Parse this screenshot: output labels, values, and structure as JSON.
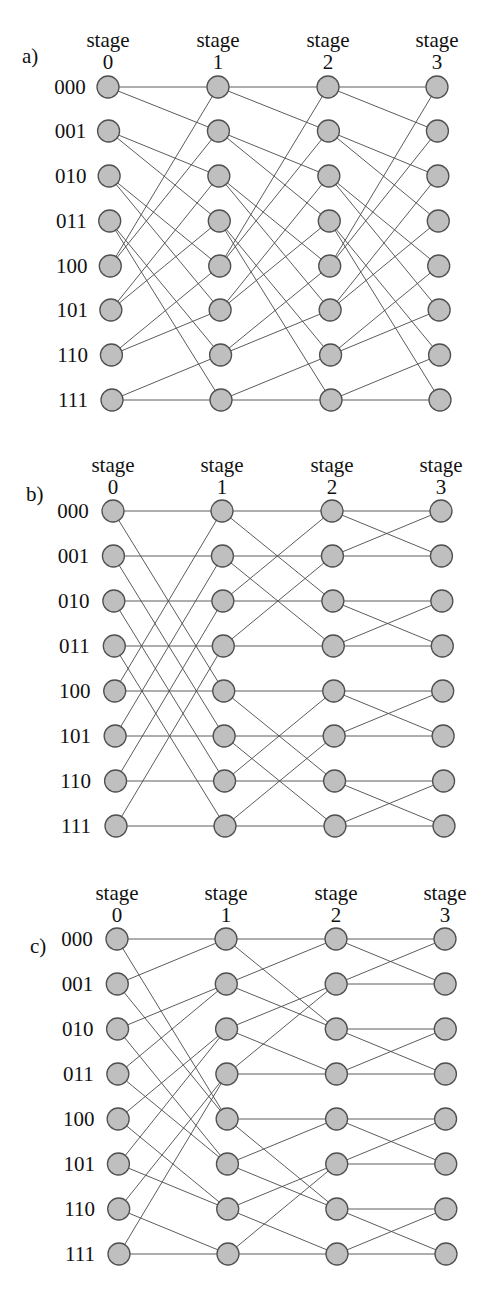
{
  "style": {
    "node_fill": "#bfbfbf",
    "node_stroke": "#505050",
    "edge_color": "#4a4a4a",
    "node_radius": 11
  },
  "stage_word": "stage",
  "row_labels": [
    "000",
    "001",
    "010",
    "011",
    "100",
    "101",
    "110",
    "111"
  ],
  "panels": [
    {
      "id": "a",
      "label": "a)",
      "network": "shuffle (omega)",
      "label_pos": [
        22,
        56
      ],
      "label_position": "above",
      "stages": [
        "0",
        "1",
        "2",
        "3"
      ],
      "col_x_top": [
        108,
        218,
        328,
        437
      ],
      "col_x_bottom": [
        112,
        221,
        331,
        440
      ],
      "row_y": [
        87,
        131,
        176,
        221,
        266,
        310,
        355,
        400
      ],
      "stage_word_y": 47,
      "stage_num_y": 69,
      "row_label_x": 70,
      "connections": [
        [
          [
            0,
            0
          ],
          [
            0,
            1
          ],
          [
            1,
            2
          ],
          [
            1,
            3
          ],
          [
            2,
            4
          ],
          [
            2,
            5
          ],
          [
            3,
            6
          ],
          [
            3,
            7
          ],
          [
            4,
            0
          ],
          [
            4,
            1
          ],
          [
            5,
            2
          ],
          [
            5,
            3
          ],
          [
            6,
            4
          ],
          [
            6,
            5
          ],
          [
            7,
            6
          ],
          [
            7,
            7
          ]
        ],
        [
          [
            0,
            0
          ],
          [
            0,
            1
          ],
          [
            1,
            2
          ],
          [
            1,
            3
          ],
          [
            2,
            4
          ],
          [
            2,
            5
          ],
          [
            3,
            6
          ],
          [
            3,
            7
          ],
          [
            4,
            0
          ],
          [
            4,
            1
          ],
          [
            5,
            2
          ],
          [
            5,
            3
          ],
          [
            6,
            4
          ],
          [
            6,
            5
          ],
          [
            7,
            6
          ],
          [
            7,
            7
          ]
        ],
        [
          [
            0,
            0
          ],
          [
            0,
            1
          ],
          [
            1,
            2
          ],
          [
            1,
            3
          ],
          [
            2,
            4
          ],
          [
            2,
            5
          ],
          [
            3,
            6
          ],
          [
            3,
            7
          ],
          [
            4,
            0
          ],
          [
            4,
            1
          ],
          [
            5,
            2
          ],
          [
            5,
            3
          ],
          [
            6,
            4
          ],
          [
            6,
            5
          ],
          [
            7,
            6
          ],
          [
            7,
            7
          ]
        ]
      ]
    },
    {
      "id": "b",
      "label": "b)",
      "network": "butterfly",
      "label_pos": [
        26,
        494
      ],
      "label_position": "above",
      "stages": [
        "0",
        "1",
        "2",
        "3"
      ],
      "col_x_top": [
        113,
        222,
        332,
        441
      ],
      "col_x_bottom": [
        116,
        225,
        335,
        444
      ],
      "row_y": [
        511,
        556,
        601,
        646,
        691,
        736,
        781,
        826
      ],
      "stage_word_y": 472,
      "stage_num_y": 494,
      "row_label_x": 73,
      "connections": [
        [
          [
            0,
            0
          ],
          [
            0,
            4
          ],
          [
            1,
            1
          ],
          [
            1,
            5
          ],
          [
            2,
            2
          ],
          [
            2,
            6
          ],
          [
            3,
            3
          ],
          [
            3,
            7
          ],
          [
            4,
            4
          ],
          [
            4,
            0
          ],
          [
            5,
            5
          ],
          [
            5,
            1
          ],
          [
            6,
            6
          ],
          [
            6,
            2
          ],
          [
            7,
            7
          ],
          [
            7,
            3
          ]
        ],
        [
          [
            0,
            0
          ],
          [
            0,
            2
          ],
          [
            1,
            1
          ],
          [
            1,
            3
          ],
          [
            2,
            2
          ],
          [
            2,
            0
          ],
          [
            3,
            3
          ],
          [
            3,
            1
          ],
          [
            4,
            4
          ],
          [
            4,
            6
          ],
          [
            5,
            5
          ],
          [
            5,
            7
          ],
          [
            6,
            6
          ],
          [
            6,
            4
          ],
          [
            7,
            7
          ],
          [
            7,
            5
          ]
        ],
        [
          [
            0,
            0
          ],
          [
            0,
            1
          ],
          [
            1,
            1
          ],
          [
            1,
            0
          ],
          [
            2,
            2
          ],
          [
            2,
            3
          ],
          [
            3,
            3
          ],
          [
            3,
            2
          ],
          [
            4,
            4
          ],
          [
            4,
            5
          ],
          [
            5,
            5
          ],
          [
            5,
            4
          ],
          [
            6,
            6
          ],
          [
            6,
            7
          ],
          [
            7,
            7
          ],
          [
            7,
            6
          ]
        ]
      ]
    },
    {
      "id": "c",
      "label": "c)",
      "network": "baseline",
      "label_pos": [
        30,
        946
      ],
      "label_position": "inline",
      "stages": [
        "0",
        "1",
        "2",
        "3"
      ],
      "col_x_top": [
        117,
        226,
        336,
        445
      ],
      "col_x_bottom": [
        119,
        228,
        337,
        446
      ],
      "row_y": [
        939,
        984,
        1029,
        1074,
        1119,
        1164,
        1209,
        1254
      ],
      "stage_word_y": 900,
      "stage_num_y": 922,
      "row_label_x": 77,
      "connections": [
        [
          [
            0,
            0
          ],
          [
            0,
            4
          ],
          [
            1,
            0
          ],
          [
            1,
            4
          ],
          [
            2,
            1
          ],
          [
            2,
            5
          ],
          [
            3,
            1
          ],
          [
            3,
            5
          ],
          [
            4,
            2
          ],
          [
            4,
            6
          ],
          [
            5,
            2
          ],
          [
            5,
            6
          ],
          [
            6,
            3
          ],
          [
            6,
            7
          ],
          [
            7,
            3
          ],
          [
            7,
            7
          ]
        ],
        [
          [
            0,
            0
          ],
          [
            0,
            2
          ],
          [
            1,
            0
          ],
          [
            1,
            2
          ],
          [
            2,
            1
          ],
          [
            2,
            3
          ],
          [
            3,
            1
          ],
          [
            3,
            3
          ],
          [
            4,
            4
          ],
          [
            4,
            6
          ],
          [
            5,
            4
          ],
          [
            5,
            6
          ],
          [
            6,
            5
          ],
          [
            6,
            7
          ],
          [
            7,
            5
          ],
          [
            7,
            7
          ]
        ],
        [
          [
            0,
            0
          ],
          [
            0,
            1
          ],
          [
            1,
            0
          ],
          [
            1,
            1
          ],
          [
            2,
            2
          ],
          [
            2,
            3
          ],
          [
            3,
            2
          ],
          [
            3,
            3
          ],
          [
            4,
            4
          ],
          [
            4,
            5
          ],
          [
            5,
            4
          ],
          [
            5,
            5
          ],
          [
            6,
            6
          ],
          [
            6,
            7
          ],
          [
            7,
            6
          ],
          [
            7,
            7
          ]
        ]
      ]
    }
  ]
}
